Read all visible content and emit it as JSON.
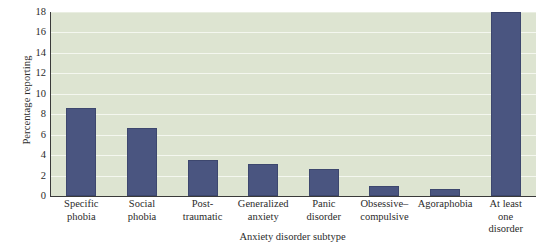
{
  "chart_data": {
    "type": "bar",
    "title": "",
    "xlabel": "Anxiety disorder subtype",
    "ylabel": "Percentage reporting",
    "categories": [
      "Specific phobia",
      "Social phobia",
      "Post-traumatic",
      "Generalized anxiety",
      "Panic disorder",
      "Obsessive–compulsive",
      "Agoraphobia",
      "At least one disorder"
    ],
    "category_lines": [
      [
        "Specific",
        "phobia"
      ],
      [
        "Social",
        "phobia"
      ],
      [
        "Post-",
        "traumatic"
      ],
      [
        "Generalized",
        "anxiety"
      ],
      [
        "Panic",
        "disorder"
      ],
      [
        "Obsessive–",
        "compulsive"
      ],
      [
        "Agoraphobia"
      ],
      [
        "At least",
        "one",
        "disorder"
      ]
    ],
    "values": [
      8.6,
      6.7,
      3.5,
      3.1,
      2.65,
      0.95,
      0.65,
      18.0
    ],
    "ylim": [
      0,
      18
    ],
    "ytick_labels": [
      "18",
      "16",
      "14",
      "12",
      "10",
      "8",
      "6",
      "4",
      "2",
      "0"
    ],
    "ytick_values": [
      18,
      16,
      14,
      12,
      10,
      8,
      6,
      4,
      2,
      0
    ],
    "grid": true,
    "legend": "none",
    "colors": {
      "bar": "#4a5580",
      "bar_border": "#3d476e",
      "plot_background": "#dde4d1",
      "gridline": "#f4f7ef",
      "axis": "#3a3a3a",
      "figure_background": "#ffffff",
      "text": "#2b2b2b"
    }
  }
}
